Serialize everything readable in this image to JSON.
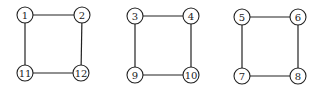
{
  "graphs": [
    {
      "name": "square-a",
      "nodes": [
        {
          "id": "1",
          "label": "1",
          "x": 25,
          "y": 15
        },
        {
          "id": "2",
          "label": "2",
          "x": 82,
          "y": 15
        },
        {
          "id": "11",
          "label": "11",
          "x": 25,
          "y": 73
        },
        {
          "id": "12",
          "label": "12",
          "x": 81,
          "y": 73
        }
      ],
      "edges": [
        [
          "1",
          "2"
        ],
        [
          "2",
          "12"
        ],
        [
          "12",
          "11"
        ],
        [
          "11",
          "1"
        ]
      ]
    },
    {
      "name": "square-b",
      "nodes": [
        {
          "id": "3",
          "label": "3",
          "x": 135,
          "y": 16
        },
        {
          "id": "4",
          "label": "4",
          "x": 191,
          "y": 16
        },
        {
          "id": "9",
          "label": "9",
          "x": 135,
          "y": 75
        },
        {
          "id": "10",
          "label": "10",
          "x": 191,
          "y": 75
        }
      ],
      "edges": [
        [
          "3",
          "4"
        ],
        [
          "4",
          "10"
        ],
        [
          "10",
          "9"
        ],
        [
          "9",
          "3"
        ]
      ]
    },
    {
      "name": "square-c",
      "nodes": [
        {
          "id": "5",
          "label": "5",
          "x": 242,
          "y": 17
        },
        {
          "id": "6",
          "label": "6",
          "x": 298,
          "y": 17
        },
        {
          "id": "7",
          "label": "7",
          "x": 242,
          "y": 76
        },
        {
          "id": "8",
          "label": "8",
          "x": 298,
          "y": 76
        }
      ],
      "edges": [
        [
          "5",
          "6"
        ],
        [
          "6",
          "8"
        ],
        [
          "8",
          "7"
        ],
        [
          "7",
          "5"
        ]
      ]
    }
  ],
  "style": {
    "node_radius": 8,
    "stroke": "#222222",
    "fill": "#ffffff"
  }
}
